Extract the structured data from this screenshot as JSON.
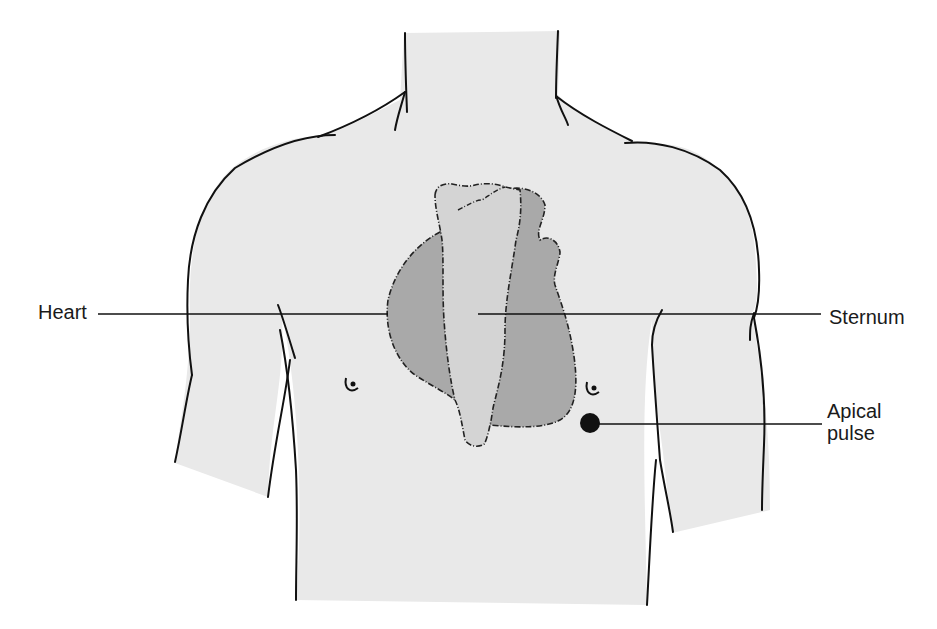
{
  "figure": {
    "type": "anatomical-illustration",
    "colors": {
      "background": "#ffffff",
      "skin": "#e9e9e9",
      "heart": "#a9a9a9",
      "sternum": "#d4d4d4",
      "outline": "#111111"
    }
  },
  "labels": {
    "heart": "Heart",
    "sternum": "Sternum",
    "apical_line1": "Apical",
    "apical_line2": "pulse"
  }
}
